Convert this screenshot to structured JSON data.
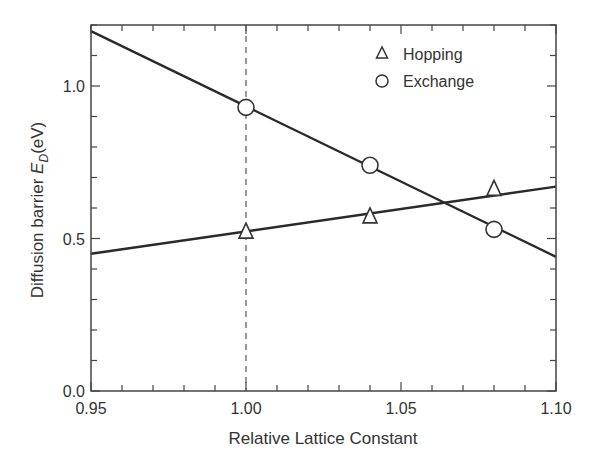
{
  "chart_data": {
    "type": "line",
    "title": "",
    "xlabel": "Relative Lattice Constant",
    "ylabel_main": "Diffusion barrier ",
    "ylabel_symbol": "E",
    "ylabel_subscript": "D",
    "ylabel_unit": "(eV)",
    "xlim": [
      0.95,
      1.1
    ],
    "ylim": [
      0.0,
      1.2
    ],
    "x_major_ticks": [
      0.95,
      1.0,
      1.05,
      1.1
    ],
    "x_tick_labels": [
      "0.95",
      "1.00",
      "1.05",
      "1.10"
    ],
    "x_minor_step": 0.01,
    "y_major_ticks": [
      0.0,
      0.5,
      1.0
    ],
    "y_tick_labels": [
      "0.0",
      "0.5",
      "1.0"
    ],
    "y_minor_step": 0.1,
    "grid": false,
    "reference_line": {
      "x": 1.0,
      "style": "dashed"
    },
    "legend_position": "top-right",
    "series": [
      {
        "name": "Hopping",
        "marker": "triangle",
        "points": {
          "x": [
            1.0,
            1.04,
            1.08
          ],
          "y": [
            0.52,
            0.57,
            0.66
          ]
        },
        "fit_line": {
          "x": [
            0.95,
            1.1
          ],
          "y": [
            0.45,
            0.67
          ]
        }
      },
      {
        "name": "Exchange",
        "marker": "circle",
        "points": {
          "x": [
            1.0,
            1.04,
            1.08
          ],
          "y": [
            0.93,
            0.74,
            0.53
          ]
        },
        "fit_line": {
          "x": [
            0.95,
            1.1
          ],
          "y": [
            1.18,
            0.44
          ]
        }
      }
    ]
  }
}
